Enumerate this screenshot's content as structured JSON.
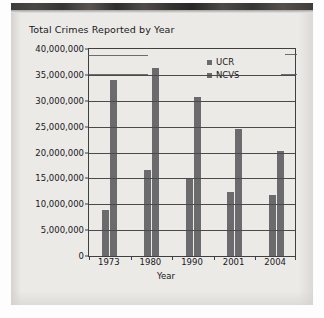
{
  "page": {
    "background_color": "#eceae7",
    "ink_color": "#17171a",
    "bar_color": "#6b6b6d",
    "axis_color": "#3f3f42"
  },
  "chart_data": {
    "type": "bar",
    "title": "Total Crimes Reported by Year",
    "xlabel": "Year",
    "ylabel": "",
    "categories": [
      "1973",
      "1980",
      "1990",
      "2001",
      "2004"
    ],
    "series": [
      {
        "name": "UCR",
        "values": [
          8800000,
          16700000,
          14800000,
          12300000,
          11700000
        ]
      },
      {
        "name": "NCVS",
        "values": [
          34000000,
          36400000,
          30800000,
          24600000,
          20300000
        ]
      }
    ],
    "ylim": [
      0,
      40000000
    ],
    "ytick_values": [
      0,
      5000000,
      10000000,
      15000000,
      20000000,
      25000000,
      30000000,
      35000000,
      40000000
    ],
    "ytick_labels": [
      "0",
      "5,000,000",
      "10,000,000",
      "15,000,000",
      "20,000,000",
      "25,000,000",
      "30,000,000",
      "35,000,000",
      "40,000,000"
    ],
    "grid": true,
    "legend_position": "upper right",
    "legend": [
      "UCR",
      "NCVS"
    ]
  }
}
